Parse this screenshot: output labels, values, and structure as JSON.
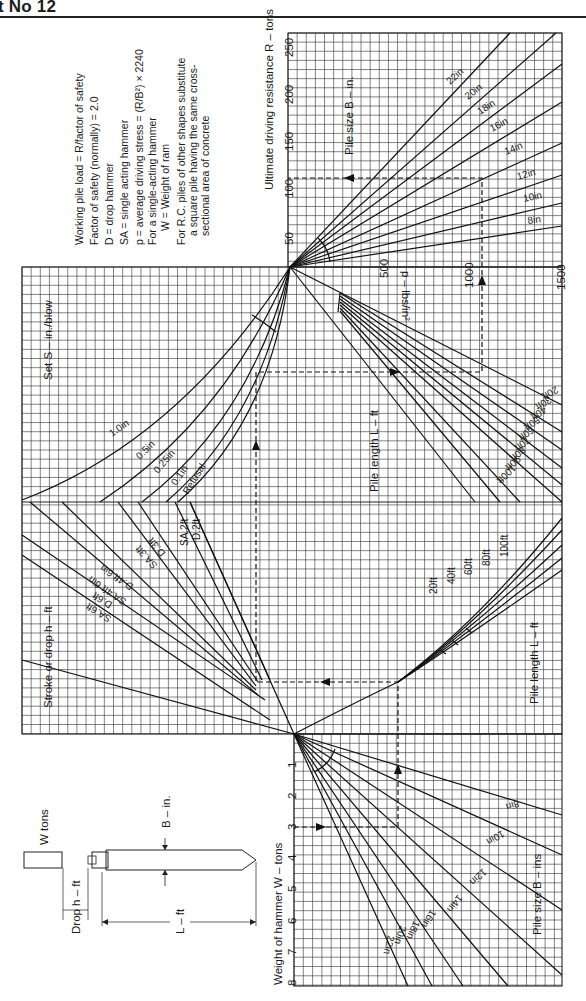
{
  "header": {
    "title": "t No 12"
  },
  "notes": [
    "Working pile load = R/factor of safety",
    "Factor of safety (normally) = 2.0",
    "D = drop hammer",
    "SA = single acting hammer",
    "p = average driving stress = (R/B²) × 2240",
    "For a single-acting hammer",
    "W = Weight of ram",
    "For R.C. piles of other shapes substitute",
    "a square pile having the same cross-",
    "sectional area of concrete"
  ],
  "sketch": {
    "w_tons": "W tons",
    "drop": "Drop h – ft",
    "b_in": "B – in.",
    "l_ft": "L – ft"
  },
  "chart_data": {
    "type": "nomogram",
    "orientation": "rotated 90° counter-clockwise",
    "scales": {
      "hammer_weight": {
        "label": "Weight of hammer  W – tons",
        "ticks": [
          "1",
          "2",
          "3",
          "4",
          "5",
          "6",
          "7",
          "8"
        ],
        "range": [
          0,
          8
        ]
      },
      "ultimate_resistance": {
        "label": "Ultimate driving resistance  R – tons",
        "ticks": [
          "50",
          "100",
          "150",
          "200",
          "250"
        ],
        "range": [
          0,
          250
        ]
      },
      "driving_stress": {
        "label": "p – lbs/in²",
        "ticks": [
          "500",
          "1000",
          "1500"
        ],
        "range": [
          0,
          1500
        ]
      }
    },
    "families": {
      "pile_size_lower": {
        "label": "Pile size  B – ins",
        "curves": [
          "8in",
          "10in",
          "12in",
          "14in",
          "16in",
          "18in",
          "20in",
          "22in"
        ]
      },
      "stroke": {
        "label": "Stroke or drop  h – ft",
        "curves": [
          "SA.6ft",
          "D.6ft",
          "SA.4ft 6in",
          "D.4ft 6in",
          "SA.3ft",
          "D.3ft",
          "SA.2ft",
          "D.2ft"
        ]
      },
      "pile_length_lower": {
        "label": "Pile length  L – ft",
        "curves": [
          "20ft",
          "40ft",
          "60ft",
          "80ft",
          "100ft"
        ]
      },
      "set": {
        "label": "Set  S – in./blow",
        "curves": [
          "1.0in",
          "0.5in",
          "0.25in",
          "0.1in",
          "Refusal"
        ]
      },
      "pile_length_upper": {
        "label": "Pile length  L – ft",
        "curves": [
          "20ft",
          "30ft",
          "40ft",
          "50ft",
          "60ft",
          "70ft",
          "80ft",
          "90ft",
          "100ft"
        ]
      },
      "pile_size_upper": {
        "label": "Pile size  B – in.",
        "curves": [
          "22in",
          "20in",
          "18in",
          "16in",
          "14in",
          "12in",
          "10in",
          "8in"
        ]
      }
    },
    "example_path": {
      "hammer_weight_tons": 3,
      "ultimate_resistance_tons": 90,
      "driving_stress_lbs_in2": 1050
    },
    "grid": true
  }
}
